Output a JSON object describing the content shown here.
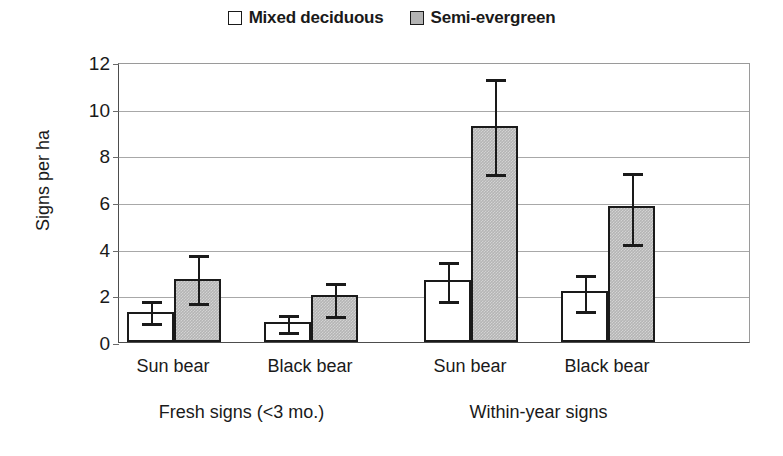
{
  "chart_data": {
    "type": "bar",
    "title": "",
    "xlabel": "",
    "ylabel": "Signs per ha",
    "ylim": [
      0,
      12
    ],
    "ytick_labels": [
      "0",
      "2",
      "4",
      "6",
      "8",
      "10",
      "12"
    ],
    "ytick_values": [
      0,
      2,
      4,
      6,
      8,
      10,
      12
    ],
    "grid": true,
    "legend_position": "top-center",
    "categories": [
      "Sun bear",
      "Black bear",
      "Sun bear",
      "Black bear"
    ],
    "group_labels": [
      "Fresh signs (<3 mo.)",
      "Within-year signs"
    ],
    "series": [
      {
        "name": "Mixed deciduous",
        "color": "#ffffff",
        "values": [
          1.3,
          0.85,
          2.65,
          2.2
        ],
        "err_upper": [
          1.85,
          1.25,
          3.5,
          2.95
        ],
        "err_lower": [
          0.9,
          0.5,
          1.85,
          1.4
        ]
      },
      {
        "name": "Semi-evergreen",
        "color": "#b5b5b5",
        "values": [
          2.7,
          2.0,
          9.25,
          5.85
        ],
        "err_upper": [
          3.8,
          2.6,
          11.35,
          7.35
        ],
        "err_lower": [
          1.75,
          1.2,
          7.3,
          4.3
        ]
      }
    ]
  },
  "legend": {
    "entries": [
      {
        "label": "Mixed deciduous",
        "style": "open"
      },
      {
        "label": "Semi-evergreen",
        "style": "filled"
      }
    ]
  },
  "axes": {
    "y_title": "Signs per ha"
  }
}
